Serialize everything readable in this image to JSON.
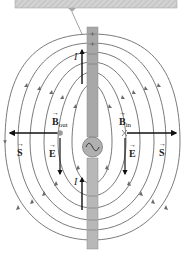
{
  "figure": {
    "caption_box": {
      "fill": "#cfcfcf",
      "hatch": "#bdbdbd"
    },
    "antenna": {
      "color": "#a8a8a8",
      "source_symbol": "~"
    },
    "field_line_color": "#6b6b6b",
    "arrow_color": "#111111"
  },
  "labels": {
    "current_top": "I",
    "current_bottom": "I",
    "B_out_main": "B",
    "B_out_sub": "out",
    "B_in_main": "B",
    "B_in_sub": "in",
    "E_left": "E",
    "E_right": "E",
    "S_left": "S",
    "S_right": "S",
    "ac_source": "~"
  }
}
